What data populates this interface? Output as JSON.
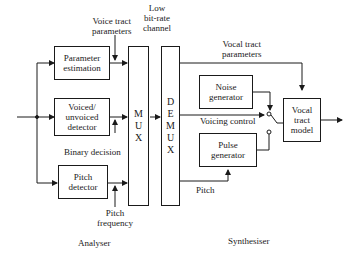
{
  "diagram": {
    "analyser": {
      "section_label": "Analyser",
      "blocks": {
        "parameter_estimation": "Parameter\nestimation",
        "voiced_unvoiced_detector": "Voiced/\nunvoiced\ndetector",
        "pitch_detector": "Pitch\ndetector"
      },
      "signals": {
        "voice_tract_parameters": "Voice tract\nparameters",
        "binary_decision": "Binary decision",
        "pitch_frequency": "Pitch\nfrequency"
      }
    },
    "channel": {
      "label": "Low\nbit-rate\nchannel",
      "mux_letters": [
        "M",
        "U",
        "X"
      ],
      "demux_letters": [
        "D",
        "E",
        "M",
        "U",
        "X"
      ]
    },
    "synthesiser": {
      "section_label": "Synthesiser",
      "blocks": {
        "noise_generator": "Noise\ngenerator",
        "pulse_generator": "Pulse\ngenerator",
        "vocal_tract_model": "Vocal\ntract\nmodel"
      },
      "signals": {
        "vocal_tract_parameters": "Vocal tract\nparameters",
        "voicing_control": "Voicing control",
        "pitch": "Pitch"
      }
    }
  }
}
